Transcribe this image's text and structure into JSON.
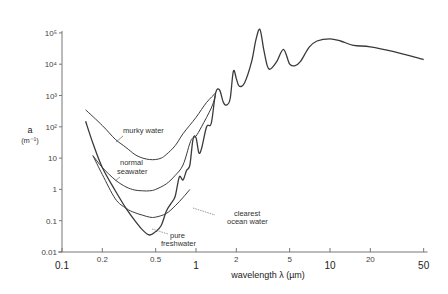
{
  "chart_data": {
    "type": "line",
    "title": "",
    "xlabel": "wavelength λ (µm)",
    "ylabel": "a",
    "ylabel_unit": "(m⁻¹)",
    "xscale": "log",
    "yscale": "log",
    "xlim": [
      0.1,
      50
    ],
    "ylim": [
      0.01,
      100000
    ],
    "grid": false,
    "x_ticks": [
      {
        "value": 0.1,
        "label": "0.1",
        "major": true
      },
      {
        "value": 0.2,
        "label": "0.2",
        "major": false
      },
      {
        "value": 0.5,
        "label": "0.5",
        "major": false
      },
      {
        "value": 1,
        "label": "1",
        "major": true
      },
      {
        "value": 2,
        "label": "2",
        "major": false
      },
      {
        "value": 5,
        "label": "5",
        "major": false
      },
      {
        "value": 10,
        "label": "10",
        "major": true
      },
      {
        "value": 20,
        "label": "20",
        "major": false
      },
      {
        "value": 50,
        "label": "50",
        "major": true
      }
    ],
    "y_ticks": [
      {
        "value": 0.01,
        "label": "0.01"
      },
      {
        "value": 0.1,
        "label": "0.1"
      },
      {
        "value": 1,
        "label": "1"
      },
      {
        "value": 10,
        "label": "10"
      },
      {
        "value": 100,
        "label": "10²"
      },
      {
        "value": 1000,
        "label": "10³"
      },
      {
        "value": 10000,
        "label": "10⁴"
      },
      {
        "value": 100000,
        "label": "10⁵"
      }
    ],
    "series": [
      {
        "name": "pure freshwater",
        "label": "pure\nfreshwater",
        "points": [
          [
            0.15,
            150
          ],
          [
            0.17,
            30
          ],
          [
            0.2,
            5
          ],
          [
            0.25,
            0.9
          ],
          [
            0.3,
            0.25
          ],
          [
            0.35,
            0.1
          ],
          [
            0.4,
            0.05
          ],
          [
            0.45,
            0.035
          ],
          [
            0.5,
            0.045
          ],
          [
            0.55,
            0.07
          ],
          [
            0.6,
            0.2
          ],
          [
            0.65,
            0.35
          ],
          [
            0.7,
            0.6
          ],
          [
            0.75,
            2.5
          ],
          [
            0.8,
            2
          ],
          [
            0.85,
            4
          ],
          [
            0.9,
            6
          ],
          [
            0.95,
            40
          ],
          [
            1.0,
            45
          ],
          [
            1.05,
            15
          ],
          [
            1.1,
            20
          ],
          [
            1.2,
            100
          ],
          [
            1.3,
            130
          ],
          [
            1.4,
            1200
          ],
          [
            1.5,
            1500
          ],
          [
            1.6,
            600
          ],
          [
            1.7,
            500
          ],
          [
            1.8,
            800
          ],
          [
            1.9,
            6000
          ],
          [
            2.0,
            3500
          ],
          [
            2.1,
            2000
          ],
          [
            2.3,
            2500
          ],
          [
            2.6,
            12000
          ],
          [
            2.8,
            60000
          ],
          [
            3.0,
            130000
          ],
          [
            3.2,
            30000
          ],
          [
            3.4,
            9000
          ],
          [
            3.6,
            7000
          ],
          [
            4.0,
            12000
          ],
          [
            4.5,
            30000
          ],
          [
            5.0,
            10000
          ],
          [
            5.5,
            9000
          ],
          [
            6.0,
            12000
          ],
          [
            7.0,
            35000
          ],
          [
            8.0,
            55000
          ],
          [
            10,
            65000
          ],
          [
            12,
            55000
          ],
          [
            15,
            40000
          ],
          [
            20,
            36000
          ],
          [
            30,
            25000
          ],
          [
            50,
            14000
          ]
        ]
      },
      {
        "name": "clearest ocean water",
        "label": "clearest\nocean water",
        "points": [
          [
            0.17,
            12
          ],
          [
            0.2,
            3
          ],
          [
            0.25,
            0.5
          ],
          [
            0.3,
            0.25
          ],
          [
            0.35,
            0.18
          ],
          [
            0.4,
            0.15
          ],
          [
            0.45,
            0.13
          ],
          [
            0.5,
            0.13
          ],
          [
            0.6,
            0.17
          ],
          [
            0.7,
            0.3
          ],
          [
            0.8,
            0.55
          ],
          [
            0.9,
            1.0
          ]
        ]
      },
      {
        "name": "normal seawater",
        "label": "normal\nseawater",
        "points": [
          [
            0.17,
            12
          ],
          [
            0.2,
            5
          ],
          [
            0.25,
            2
          ],
          [
            0.3,
            1.2
          ],
          [
            0.35,
            0.95
          ],
          [
            0.4,
            0.9
          ],
          [
            0.45,
            0.9
          ],
          [
            0.5,
            1.0
          ],
          [
            0.6,
            1.5
          ],
          [
            0.7,
            2.8
          ],
          [
            0.8,
            6
          ],
          [
            0.9,
            30
          ],
          [
            0.95,
            45
          ],
          [
            1.0,
            50
          ],
          [
            1.1,
            100
          ],
          [
            1.3,
            400
          ],
          [
            1.4,
            1000
          ]
        ]
      },
      {
        "name": "murky water",
        "label": "murky water",
        "points": [
          [
            0.15,
            350
          ],
          [
            0.2,
            110
          ],
          [
            0.25,
            40
          ],
          [
            0.3,
            22
          ],
          [
            0.35,
            13
          ],
          [
            0.4,
            10
          ],
          [
            0.45,
            9
          ],
          [
            0.5,
            9
          ],
          [
            0.55,
            10
          ],
          [
            0.6,
            13
          ],
          [
            0.7,
            25
          ],
          [
            0.8,
            60
          ],
          [
            1.0,
            200
          ],
          [
            1.2,
            600
          ],
          [
            1.4,
            1200
          ]
        ]
      }
    ],
    "annotations": [
      {
        "text": "murky water",
        "target": "murky water"
      },
      {
        "text": "normal seawater",
        "target": "normal seawater"
      },
      {
        "text": "clearest ocean water",
        "target": "clearest ocean water"
      },
      {
        "text": "pure freshwater",
        "target": "pure freshwater"
      }
    ]
  },
  "labels": {
    "ylabel": "a",
    "ylabel_unit": "(m⁻¹)",
    "xlabel": "wavelength λ (µm)",
    "ann_murky": "murky water",
    "ann_normal_1": "normal",
    "ann_normal_2": "seawater",
    "ann_clear_1": "clearest",
    "ann_clear_2": "ocean water",
    "ann_pure_1": "pure",
    "ann_pure_2": "freshwater"
  },
  "colors": {
    "curve": "#3a3a3a",
    "axis": "#777777",
    "text": "#333333"
  }
}
